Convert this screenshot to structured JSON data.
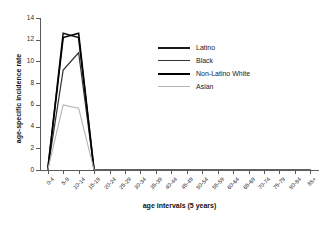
{
  "chart_data": {
    "type": "line",
    "title": "",
    "xlabel": "age intervals (5 years)",
    "ylabel": "age-specific incidence rate",
    "ylim": [
      0,
      14
    ],
    "yticks": [
      0,
      2,
      4,
      6,
      8,
      10,
      12,
      14
    ],
    "grid": false,
    "legend_position": "center-right",
    "categories": [
      "0-4",
      "5-9",
      "10-14",
      "15-19",
      "20-24",
      "25-29",
      "30-34",
      "35-39",
      "40-44",
      "45-49",
      "50-54",
      "55-59",
      "60-64",
      "65-69",
      "70-74",
      "75-79",
      "80-84",
      "85+"
    ],
    "series": [
      {
        "name": "Latino",
        "color": "#1a1a1a",
        "values": [
          0,
          12.6,
          12.2,
          0,
          0,
          0,
          0,
          0,
          0,
          0,
          0,
          0,
          0,
          0,
          0,
          0,
          0,
          0
        ]
      },
      {
        "name": "Black",
        "color": "#333333",
        "values": [
          0,
          9.2,
          10.8,
          0,
          0,
          0,
          0,
          0,
          0,
          0,
          0,
          0,
          0,
          0,
          0,
          0,
          0,
          0
        ]
      },
      {
        "name": "Non-Latino White",
        "color": "#000000",
        "values": [
          0,
          12.2,
          12.6,
          0,
          0,
          0,
          0,
          0,
          0,
          0,
          0,
          0,
          0,
          0,
          0,
          0,
          0,
          0
        ]
      },
      {
        "name": "Asian",
        "color": "#b4b4b4",
        "values": [
          0,
          6.0,
          5.7,
          0,
          0,
          0,
          0,
          0,
          0,
          0,
          0,
          0,
          0,
          0,
          0,
          0,
          0,
          0
        ]
      }
    ]
  },
  "axes": {
    "y_title": "age-specific incidence rate",
    "x_title": "age intervals (5 years)",
    "y_tick_labels": [
      "0",
      "2",
      "4",
      "6",
      "8",
      "10",
      "12",
      "14"
    ],
    "x_tick_labels": [
      "0-4",
      "5-9",
      "10-14",
      "15-19",
      "20-24",
      "25-29",
      "30-34",
      "35-39",
      "40-44",
      "45-49",
      "50-54",
      "55-59",
      "60-64",
      "65-69",
      "70-74",
      "75-79",
      "80-84",
      "85+"
    ]
  },
  "legend": {
    "entries": [
      {
        "label": "Latino",
        "color": "#1a1a1a",
        "width": 2.2
      },
      {
        "label": "Black",
        "color": "#333333",
        "width": 1.8
      },
      {
        "label": "Non-Latino White",
        "color": "#000000",
        "width": 2.0
      },
      {
        "label": "Asian",
        "color": "#b4b4b4",
        "width": 1.6
      }
    ]
  }
}
